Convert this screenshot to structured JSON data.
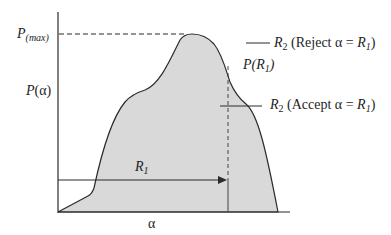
{
  "diagram": {
    "title": "",
    "y_axis_label": "P(α)",
    "x_axis_label": "α",
    "labels": {
      "p_max": {
        "main": "P",
        "sub": "(max)"
      },
      "p_alpha": "P(α)",
      "alpha": "α",
      "r1_arrow": {
        "main": "R",
        "sub": "1"
      },
      "p_r1": {
        "pre": "P(",
        "main": "R",
        "sub": "1",
        "post": ")"
      },
      "r2_reject": {
        "main": "R",
        "sub": "2",
        "text": " (Reject α = ",
        "r": "R",
        "rsub": "1",
        "close": ")"
      },
      "r2_accept": {
        "main": "R",
        "sub": "2",
        "text": " (Accept α = ",
        "r": "R",
        "rsub": "1",
        "close": ")"
      }
    },
    "colors": {
      "fill": "#d9d9d9",
      "stroke": "#2a2a2a",
      "background": "#ffffff"
    }
  }
}
